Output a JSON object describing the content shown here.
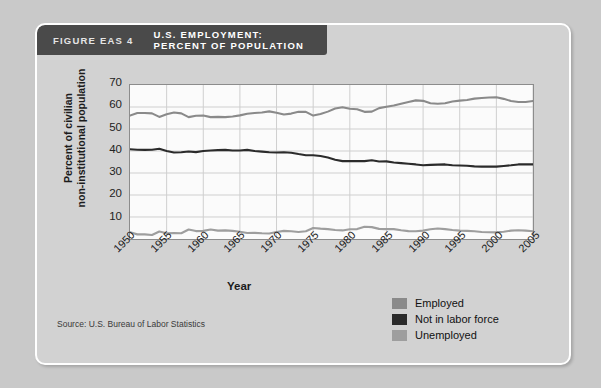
{
  "figure": {
    "label": "FIGURE EAS 4",
    "title_line1": "U.S. EMPLOYMENT:",
    "title_line2": "PERCENT OF POPULATION"
  },
  "source": "Source: U.S. Bureau of Labor Statistics",
  "colors": {
    "employed": "#8a8a8a",
    "not_in_labor_force": "#2b2b2b",
    "unemployed": "#9e9e9e",
    "header_bar": "#4a4a4a",
    "card_background": "#d2d2d2",
    "plot_background": "#fbfbfb",
    "gridline": "#cfcfcf",
    "page_background": "#c9c9c9"
  },
  "legend": {
    "items": [
      {
        "label": "Employed",
        "color": "#8a8a8a"
      },
      {
        "label": "Not in labor force",
        "color": "#2b2b2b"
      },
      {
        "label": "Unemployed",
        "color": "#9e9e9e"
      }
    ]
  },
  "chart_data": {
    "type": "line",
    "title": "U.S. EMPLOYMENT: PERCENT OF POPULATION",
    "xlabel": "Year",
    "ylabel": "Percent of civilian non-institutional population",
    "xlim": [
      1950,
      2005
    ],
    "ylim": [
      0,
      70
    ],
    "yticks": [
      10,
      20,
      30,
      40,
      50,
      60,
      70
    ],
    "xticks": [
      1950,
      1955,
      1960,
      1965,
      1970,
      1975,
      1980,
      1985,
      1990,
      1995,
      2000,
      2005
    ],
    "grid": true,
    "legend_position": "bottom-right",
    "x": [
      1950,
      1951,
      1952,
      1953,
      1954,
      1955,
      1956,
      1957,
      1958,
      1959,
      1960,
      1961,
      1962,
      1963,
      1964,
      1965,
      1966,
      1967,
      1968,
      1969,
      1970,
      1971,
      1972,
      1973,
      1974,
      1975,
      1976,
      1977,
      1978,
      1979,
      1980,
      1981,
      1982,
      1983,
      1984,
      1985,
      1986,
      1987,
      1988,
      1989,
      1990,
      1991,
      1992,
      1993,
      1994,
      1995,
      1996,
      1997,
      1998,
      1999,
      2000,
      2001,
      2002,
      2003,
      2004,
      2005
    ],
    "series": [
      {
        "name": "Employed",
        "color": "#8a8a8a",
        "values": [
          56.1,
          57.3,
          57.3,
          57.1,
          55.5,
          56.7,
          57.5,
          57.1,
          55.4,
          56.0,
          56.1,
          55.4,
          55.5,
          55.4,
          55.7,
          56.2,
          56.9,
          57.3,
          57.5,
          58.0,
          57.4,
          56.6,
          57.0,
          57.8,
          57.8,
          56.1,
          56.8,
          57.9,
          59.3,
          59.9,
          59.2,
          59.0,
          57.8,
          57.9,
          59.5,
          60.1,
          60.7,
          61.5,
          62.3,
          63.0,
          62.8,
          61.7,
          61.5,
          61.7,
          62.5,
          62.9,
          63.2,
          63.8,
          64.1,
          64.3,
          64.4,
          63.7,
          62.7,
          62.3,
          62.3,
          62.7
        ]
      },
      {
        "name": "Not in labor force",
        "color": "#2b2b2b",
        "values": [
          40.8,
          40.6,
          40.5,
          40.6,
          41.0,
          40.0,
          39.3,
          39.4,
          39.8,
          39.5,
          40.0,
          40.2,
          40.4,
          40.5,
          40.2,
          40.2,
          40.5,
          40.0,
          39.7,
          39.4,
          39.3,
          39.4,
          39.2,
          38.6,
          38.1,
          38.1,
          37.7,
          37.0,
          36.0,
          35.4,
          35.4,
          35.4,
          35.4,
          35.8,
          35.2,
          35.3,
          34.8,
          34.5,
          34.2,
          33.9,
          33.5,
          33.7,
          33.8,
          33.9,
          33.5,
          33.4,
          33.3,
          33.0,
          32.9,
          32.9,
          32.9,
          33.2,
          33.5,
          33.9,
          34.0,
          33.9
        ]
      },
      {
        "name": "Unemployed",
        "color": "#9e9e9e",
        "values": [
          3.1,
          2.1,
          2.1,
          1.8,
          3.4,
          2.6,
          2.7,
          2.6,
          4.3,
          3.6,
          3.7,
          4.3,
          3.8,
          3.9,
          3.7,
          3.3,
          2.7,
          2.8,
          2.6,
          2.5,
          3.2,
          3.7,
          3.5,
          3.2,
          3.5,
          5.0,
          4.7,
          4.5,
          4.1,
          3.9,
          4.4,
          4.5,
          5.6,
          5.4,
          4.6,
          4.5,
          4.5,
          4.0,
          3.6,
          3.5,
          3.8,
          4.4,
          4.8,
          4.5,
          4.1,
          3.8,
          3.7,
          3.5,
          3.2,
          3.1,
          3.0,
          3.3,
          3.8,
          4.0,
          3.8,
          3.5
        ]
      }
    ]
  }
}
